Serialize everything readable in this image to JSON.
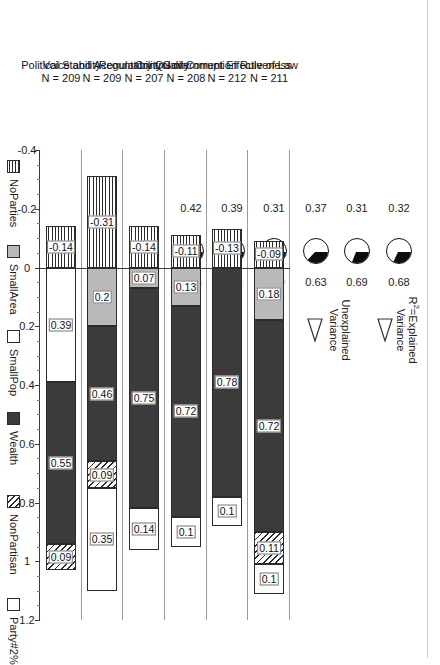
{
  "annotations": {
    "r2_label_line1": "R",
    "r2_label_sup": "2",
    "r2_label_line1b": "=Explained",
    "r2_label_line2": "Variance",
    "unexplained_line1": "Unexplained",
    "unexplained_line2": "Variance",
    "arrow_r2": "arrow-right-icon",
    "arrow_unexplained": "arrow-right-icon"
  },
  "legend": {
    "position": "bottom",
    "items": [
      {
        "key": "noparties",
        "label": "NoParties",
        "color": "#ffffff",
        "pattern": "horizontal-lines"
      },
      {
        "key": "smallarea",
        "label": "SmallArea",
        "color": "#b9b9b9",
        "pattern": "solid"
      },
      {
        "key": "smallpop",
        "label": "SmallPop",
        "color": "#ffffff",
        "pattern": "solid"
      },
      {
        "key": "wealth",
        "label": "Wealth",
        "color": "#3b3b3b",
        "pattern": "solid"
      },
      {
        "key": "nonpartisan",
        "label": "NonPartisan",
        "color": "#ffffff",
        "pattern": "diagonal-hatch"
      },
      {
        "key": "party",
        "label": "Party#2%",
        "color": "#ffffff",
        "pattern": "solid"
      }
    ]
  },
  "chart_data": {
    "type": "bar",
    "subtype": "stacked-horizontal-diverging",
    "title": "",
    "xlabel": "",
    "ylabel": "",
    "xlim": [
      -0.4,
      1.2
    ],
    "xticks": [
      -0.4,
      -0.2,
      0,
      0.2,
      0.4,
      0.6,
      0.8,
      1,
      1.2
    ],
    "xticklabels": [
      "-0.4",
      "-0.2",
      "0",
      "0.2",
      "0.4",
      "0.6",
      "0.8",
      "1",
      "1.2"
    ],
    "grid": false,
    "categories": [
      "Rule of Law",
      "Government Effectiveness",
      "Control of Corruption",
      "Regulatory Quality",
      "Voice and Accountability",
      "Political Stability"
    ],
    "category_sublabels": [
      "N = 211",
      "N = 212",
      "N = 208",
      "N = 207",
      "N = 209",
      "N = 209"
    ],
    "series": [
      {
        "name": "NoParties",
        "values": [
          -0.09,
          -0.13,
          -0.11,
          -0.14,
          -0.31,
          -0.14
        ]
      },
      {
        "name": "SmallArea",
        "values": [
          0.18,
          null,
          0.13,
          0.07,
          0.2,
          null
        ]
      },
      {
        "name": "SmallPop",
        "values": [
          null,
          null,
          null,
          null,
          null,
          0.39
        ]
      },
      {
        "name": "Wealth",
        "values": [
          0.72,
          0.78,
          0.72,
          0.75,
          0.46,
          0.55
        ]
      },
      {
        "name": "NonPartisan",
        "values": [
          0.11,
          null,
          null,
          null,
          0.09,
          0.09
        ]
      },
      {
        "name": "Party#2%",
        "values": [
          0.1,
          0.1,
          0.1,
          0.14,
          0.35,
          null
        ]
      }
    ],
    "bars": [
      {
        "category": "Rule of Law",
        "n": "N = 211",
        "unexplained": 0.32,
        "explained": 0.68,
        "segments": [
          {
            "key": "noparties",
            "value": -0.09,
            "label": "-0.09"
          },
          {
            "key": "smallpop",
            "value": 0.18,
            "label": "0.18"
          },
          {
            "key": "wealth",
            "value": 0.72,
            "label": "0.72"
          },
          {
            "key": "nonpartisan",
            "value": 0.11,
            "label": "0.11"
          },
          {
            "key": "party",
            "value": 0.1,
            "label": "0.1"
          }
        ]
      },
      {
        "category": "Government Effectiveness",
        "n": "N = 212",
        "unexplained": 0.31,
        "explained": 0.69,
        "segments": [
          {
            "key": "noparties",
            "value": -0.13,
            "label": "-0.13"
          },
          {
            "key": "wealth",
            "value": 0.78,
            "label": "0.78"
          },
          {
            "key": "party",
            "value": 0.1,
            "label": "0.1"
          }
        ]
      },
      {
        "category": "Control of Corruption",
        "n": "N = 208",
        "unexplained": 0.37,
        "explained": 0.63,
        "segments": [
          {
            "key": "noparties",
            "value": -0.11,
            "label": "-0.11"
          },
          {
            "key": "smallpop",
            "value": 0.13,
            "label": "0.13"
          },
          {
            "key": "wealth",
            "value": 0.72,
            "label": "0.72"
          },
          {
            "key": "party",
            "value": 0.1,
            "label": "0.1"
          }
        ]
      },
      {
        "category": "Regulatory Quality",
        "n": "N = 207",
        "unexplained": 0.31,
        "explained": 0.69,
        "segments": [
          {
            "key": "noparties",
            "value": -0.14,
            "label": "-0.14"
          },
          {
            "key": "smallpop",
            "value": 0.07,
            "label": "0.07"
          },
          {
            "key": "wealth",
            "value": 0.75,
            "label": "0.75"
          },
          {
            "key": "party",
            "value": 0.14,
            "label": "0.14"
          }
        ]
      },
      {
        "category": "Voice and Accountability",
        "n": "N = 209",
        "unexplained": 0.39,
        "explained": 0.61,
        "segments": [
          {
            "key": "noparties",
            "value": -0.31,
            "label": "-0.31"
          },
          {
            "key": "smallpop",
            "value": 0.2,
            "label": "0.2"
          },
          {
            "key": "wealth",
            "value": 0.46,
            "label": "0.46"
          },
          {
            "key": "nonpartisan",
            "value": 0.09,
            "label": "0.09"
          },
          {
            "key": "party",
            "value": 0.35,
            "label": "0.35"
          }
        ]
      },
      {
        "category": "Political Stability",
        "n": "N = 209",
        "unexplained": 0.42,
        "explained": 0.58,
        "segments": [
          {
            "key": "noparties",
            "value": -0.14,
            "label": "-0.14"
          },
          {
            "key": "party",
            "value": 0.39,
            "label": "0.39"
          },
          {
            "key": "wealth",
            "value": 0.55,
            "label": "0.55"
          },
          {
            "key": "nonpartisan",
            "value": 0.09,
            "label": "0.09"
          }
        ]
      }
    ],
    "pies": [
      {
        "category": "Rule of Law",
        "unexplained": 0.32,
        "explained": 0.68,
        "unexplained_label": "0.32",
        "explained_label": "0.68"
      },
      {
        "category": "Government Effectiveness",
        "unexplained": 0.31,
        "explained": 0.69,
        "unexplained_label": "0.31",
        "explained_label": "0.69"
      },
      {
        "category": "Control of Corruption",
        "unexplained": 0.37,
        "explained": 0.63,
        "unexplained_label": "0.37",
        "explained_label": "0.63"
      },
      {
        "category": "Regulatory Quality",
        "unexplained": 0.31,
        "explained": 0.69,
        "unexplained_label": "0.31",
        "explained_label": "0.69"
      },
      {
        "category": "Voice and Accountability",
        "unexplained": 0.39,
        "explained": 0.61,
        "unexplained_label": "0.39",
        "explained_label": "0.61"
      },
      {
        "category": "Political Stability",
        "unexplained": 0.42,
        "explained": 0.58,
        "unexplained_label": "0.42",
        "explained_label": "0.58"
      }
    ]
  }
}
